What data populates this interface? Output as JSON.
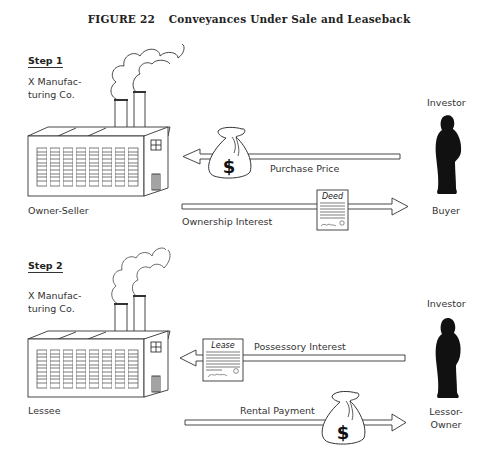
{
  "figure": {
    "number": "FIGURE 22",
    "title": "Conveyances Under Sale and Leaseback"
  },
  "steps": [
    {
      "label": "Step 1",
      "company": [
        "X Manufac-",
        "turing Co."
      ],
      "left_role": "Owner-Seller",
      "right_title": "Investor",
      "right_role": [
        "Buyer"
      ],
      "flows": [
        {
          "label": "Purchase Price",
          "direction": "left",
          "icon": "money-bag-icon"
        },
        {
          "label": "Ownership Interest",
          "direction": "right",
          "icon": "deed-document-icon",
          "doc_title": "Deed"
        }
      ]
    },
    {
      "label": "Step 2",
      "company": [
        "X Manufac-",
        "turing Co."
      ],
      "left_role": "Lessee",
      "right_title": "Investor",
      "right_role": [
        "Lessor-",
        "Owner"
      ],
      "flows": [
        {
          "label": "Possessory Interest",
          "direction": "left",
          "icon": "lease-document-icon",
          "doc_title": "Lease"
        },
        {
          "label": "Rental Payment",
          "direction": "right",
          "icon": "money-bag-icon"
        }
      ]
    }
  ],
  "icons": {
    "dollar": "$"
  },
  "colors": {
    "ink": "#222222",
    "silhouette": "#111111",
    "background": "#ffffff"
  }
}
